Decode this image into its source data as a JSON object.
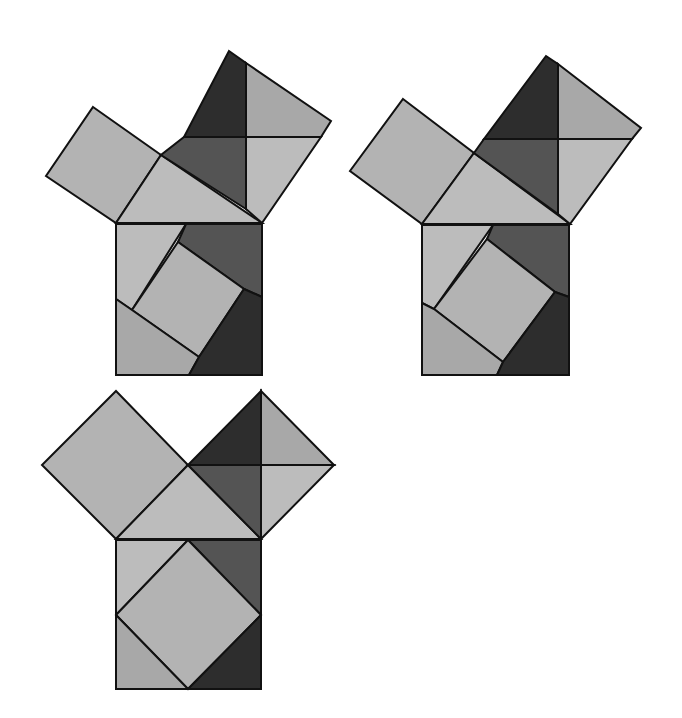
{
  "colors": {
    "background": "#ffffff",
    "stroke": "#111111",
    "darkest": "#2d2d2d",
    "dark": "#545454",
    "mid": "#a8a8a8",
    "light": "#b3b3b3",
    "lightest": "#bcbcbc"
  },
  "figures": [
    {
      "id": "figure-1",
      "pieces": [
        {
          "name": "leg-square-small",
          "fill": "light",
          "points": "93,107 161,155 116,223 46,176"
        },
        {
          "name": "right-triangle-top",
          "fill": "lightest",
          "points": "161,155 262,223 116,223"
        },
        {
          "name": "leg-square-large-top-left",
          "fill": "darkest",
          "points": "229,51 246,63 246,137 184,137"
        },
        {
          "name": "leg-square-large-top-right",
          "fill": "mid",
          "points": "246,63 331,121 321,137 246,137"
        },
        {
          "name": "leg-square-large-bottom-left",
          "fill": "dark",
          "points": "184,137 246,137 246,209 161,155"
        },
        {
          "name": "leg-square-large-bottom-right",
          "fill": "lightest",
          "points": "246,137 321,137 262,223 246,209"
        },
        {
          "name": "hyp-square-top-left",
          "fill": "lightest",
          "points": "116,224 186,224 132,310 116,299"
        },
        {
          "name": "hyp-square-top-right",
          "fill": "dark",
          "points": "186,224 262,224 262,297 244,289 178,242"
        },
        {
          "name": "hyp-square-center",
          "fill": "light",
          "points": "178,242 244,289 199,357 132,310"
        },
        {
          "name": "hyp-square-bottom-left",
          "fill": "mid",
          "points": "116,299 132,310 199,357 189,375 116,375"
        },
        {
          "name": "hyp-square-bottom-right",
          "fill": "darkest",
          "points": "244,289 262,297 262,375 189,375 199,357"
        }
      ]
    },
    {
      "id": "figure-2",
      "pieces": [
        {
          "name": "leg-square-small",
          "fill": "light",
          "points": "403,99 474,153 422,224 350,171"
        },
        {
          "name": "right-triangle-top",
          "fill": "lightest",
          "points": "474,153 570,224 422,224"
        },
        {
          "name": "leg-square-large-top-left",
          "fill": "darkest",
          "points": "546,56 558,64 558,139 484,139"
        },
        {
          "name": "leg-square-large-top-right",
          "fill": "mid",
          "points": "558,64 641,128 632,139 558,139"
        },
        {
          "name": "leg-square-large-bottom-left",
          "fill": "dark",
          "points": "484,139 558,139 558,214 474,153"
        },
        {
          "name": "leg-square-large-bottom-right",
          "fill": "lightest",
          "points": "558,139 632,139 570,224 558,214"
        },
        {
          "name": "hyp-square-top-left",
          "fill": "lightest",
          "points": "422,225 493,225 434,309 422,303"
        },
        {
          "name": "hyp-square-top-right",
          "fill": "dark",
          "points": "493,225 569,225 569,297 555,292 487,239"
        },
        {
          "name": "hyp-square-center",
          "fill": "light",
          "points": "487,239 555,292 503,362 434,309"
        },
        {
          "name": "hyp-square-bottom-left",
          "fill": "mid",
          "points": "422,303 434,309 503,362 497,375 422,375"
        },
        {
          "name": "hyp-square-bottom-right",
          "fill": "darkest",
          "points": "555,292 569,297 569,375 497,375 503,362"
        }
      ]
    },
    {
      "id": "figure-3",
      "pieces": [
        {
          "name": "leg-square-left",
          "fill": "light",
          "points": "116,391 188,465 116,539 42,465"
        },
        {
          "name": "right-triangle-top",
          "fill": "lightest",
          "points": "188,465 261,539 116,539"
        },
        {
          "name": "leg-square-right-top-left",
          "fill": "darkest",
          "points": "261,391 261,465 188,465"
        },
        {
          "name": "leg-square-right-top-right",
          "fill": "mid",
          "points": "261,391 334,465 261,465"
        },
        {
          "name": "leg-square-right-bottom-left",
          "fill": "dark",
          "points": "188,465 261,465 261,539"
        },
        {
          "name": "leg-square-right-bottom-right",
          "fill": "lightest",
          "points": "261,465 334,465 261,539"
        },
        {
          "name": "hyp-square-top-left",
          "fill": "lightest",
          "points": "116,540 188,540 116,615"
        },
        {
          "name": "hyp-square-top-right",
          "fill": "dark",
          "points": "188,540 261,540 261,615"
        },
        {
          "name": "hyp-square-center",
          "fill": "light",
          "points": "188,540 261,615 188,689 116,615"
        },
        {
          "name": "hyp-square-bottom-left",
          "fill": "mid",
          "points": "116,615 188,689 116,689"
        },
        {
          "name": "hyp-square-bottom-right",
          "fill": "darkest",
          "points": "261,615 261,689 188,689"
        }
      ]
    }
  ]
}
